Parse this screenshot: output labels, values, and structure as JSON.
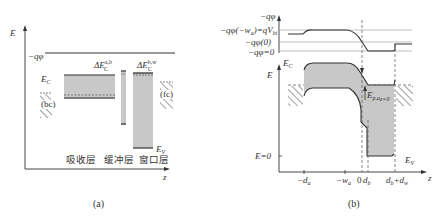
{
  "panel_a": {
    "caption": "(a)",
    "y_axis_label": "E",
    "x_axis_label": "z",
    "vacuum_label": "−qφ",
    "ec_label": "E",
    "ec_sub": "C",
    "ev_label": "E",
    "ev_sub": "V",
    "delta_ab": {
      "main": "ΔE",
      "sub": "C",
      "sup": "a,b"
    },
    "delta_bw": {
      "main": "ΔE",
      "sub": "C",
      "sup": "b,w"
    },
    "back_contact": "(bc)",
    "front_contact": "(fc)",
    "layers": [
      "吸收层",
      "缓冲层",
      "窗口层"
    ]
  },
  "panel_b": {
    "caption": "(b)",
    "potential_axis_label": "−qφ",
    "potential_levels": [
      "−qφ(−w_a)=qV_bi",
      "−qφ(0)",
      "−qφ=0"
    ],
    "pot_l1": "−qφ(−w",
    "pot_l1_sub": "a",
    "pot_l1_rest": ")=qV",
    "pot_l1_sub2": "bi",
    "pot_l2": "−qφ(0)",
    "pot_l3": "−qφ=0",
    "energy_axis_label": "E",
    "ec_label": "E",
    "ec_sub": "C",
    "ev_label": "E",
    "ev_sub": "V",
    "e_zero": "E=0",
    "barrier_label": "E",
    "barrier_sub": "p,a",
    "barrier_subsub": "z=0",
    "x_ticks": {
      "neg_da": "−d",
      "neg_da_sub": "a",
      "neg_wa": "−w",
      "neg_wa_sub": "a",
      "zero": "0",
      "db": "d",
      "db_sub": "b",
      "dbdw_1": "d",
      "dbdw_sub1": "b",
      "dbdw_plus": "+d",
      "dbdw_sub2": "w"
    },
    "x_axis_label": "z"
  },
  "colors": {
    "band_fill": "#c8c8c8",
    "line": "#333333",
    "dashed": "#555555",
    "hatch": "#444444"
  }
}
